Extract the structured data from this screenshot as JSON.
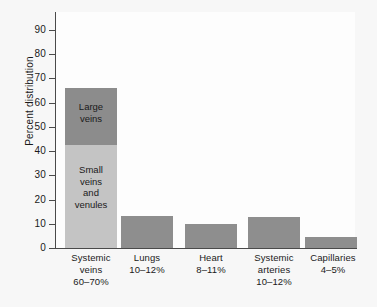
{
  "chart_data": {
    "type": "bar",
    "title": "",
    "xlabel": "",
    "ylabel": "Percent distribution",
    "ylim": [
      0,
      95
    ],
    "yticks": [
      0,
      10,
      20,
      30,
      40,
      50,
      60,
      70,
      80,
      90
    ],
    "ytick_labels": [
      "0",
      "10",
      "20",
      "30",
      "40",
      "50",
      "60",
      "70",
      "80",
      "90"
    ],
    "grid": false,
    "legend": "none",
    "stacked_first_bar": true,
    "categories": [
      "Systemic veins",
      "Lungs",
      "Heart",
      "Systemic arteries",
      "Capillaries"
    ],
    "values": [
      66,
      13.2,
      10,
      12.8,
      4.5
    ],
    "segments": [
      {
        "label": "Small veins and venules",
        "from": 0,
        "to": 42.5,
        "color": "#c4c4c4"
      },
      {
        "label": "Large veins",
        "from": 42.5,
        "to": 66,
        "color": "#8c8c8c"
      }
    ],
    "bar_color": "#8e8e8e",
    "bars": [
      {
        "category": "Systemic veins",
        "range_label": "60–70%",
        "total": 66,
        "stacked": [
          {
            "name": "Small veins and venules",
            "value": 42.5,
            "color": "#c4c4c4"
          },
          {
            "name": "Large veins",
            "value": 23.5,
            "color": "#8c8c8c"
          }
        ]
      },
      {
        "category": "Lungs",
        "range_label": "10–12%",
        "total": 13.2,
        "color": "#8e8e8e"
      },
      {
        "category": "Heart",
        "range_label": "8–11%",
        "total": 10,
        "color": "#8e8e8e"
      },
      {
        "category": "Systemic arteries",
        "range_label": "10–12%",
        "total": 12.8,
        "color": "#8e8e8e"
      },
      {
        "category": "Capillaries",
        "range_label": "4–5%",
        "total": 4.5,
        "color": "#8e8e8e"
      }
    ]
  },
  "axis": {
    "y_title": "Percent distribution",
    "ticks": [
      "90",
      "80",
      "70",
      "60",
      "50",
      "40",
      "30",
      "20",
      "10",
      "0"
    ]
  },
  "bar_labels": {
    "large_veins_line1": "Large",
    "large_veins_line2": "veins",
    "small_veins_line1": "Small",
    "small_veins_line2": "veins",
    "small_veins_line3": "and",
    "small_veins_line4": "venules"
  },
  "x_labels": [
    {
      "line1": "Systemic",
      "line2": "veins",
      "line3": "60–70%"
    },
    {
      "line1": "Lungs",
      "line2": "10–12%",
      "line3": ""
    },
    {
      "line1": "Heart",
      "line2": "8–11%",
      "line3": ""
    },
    {
      "line1": "Systemic",
      "line2": "arteries",
      "line3": "10–12%"
    },
    {
      "line1": "Capillaries",
      "line2": "4–5%",
      "line3": ""
    }
  ],
  "colors": {
    "page_background": "#f7f7f7",
    "plot_background": "#fdfdfd",
    "axis": "#4a4a4a",
    "bar_mid_gray": "#8e8e8e",
    "bar_dark_gray": "#8c8c8c",
    "bar_light_gray": "#c4c4c4",
    "text": "#1a1a1a"
  }
}
